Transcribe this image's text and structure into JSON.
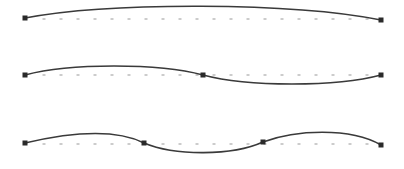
{
  "canvas": {
    "width": 404,
    "height": 169,
    "background": "#ffffff"
  },
  "style": {
    "curve_color": "#3a3a3a",
    "curve_width": 1.6,
    "node_color": "#2a2a2a",
    "node_size": 5,
    "baseline_dot_color": "#9a9a9a",
    "baseline_dot_spacing": 17
  },
  "rows": [
    {
      "name": "single-segment",
      "baseline_y": 19,
      "nodes": [
        [
          25,
          18
        ],
        [
          381,
          20
        ]
      ],
      "path": "M25,18 C110,2 290,2 381,20"
    },
    {
      "name": "two-segment",
      "baseline_y": 75,
      "nodes": [
        [
          25,
          75
        ],
        [
          203,
          75
        ],
        [
          381,
          75
        ]
      ],
      "path": "M25,75 C70,63 158,63 203,75 C248,87 336,87 381,75"
    },
    {
      "name": "three-segment",
      "baseline_y": 144,
      "nodes": [
        [
          25,
          143
        ],
        [
          144,
          143
        ],
        [
          263,
          142
        ],
        [
          381,
          145
        ]
      ],
      "path": "M25,143 C55,136 110,126 144,143 C175,156 232,156 263,142 C295,130 350,127 381,145"
    }
  ]
}
